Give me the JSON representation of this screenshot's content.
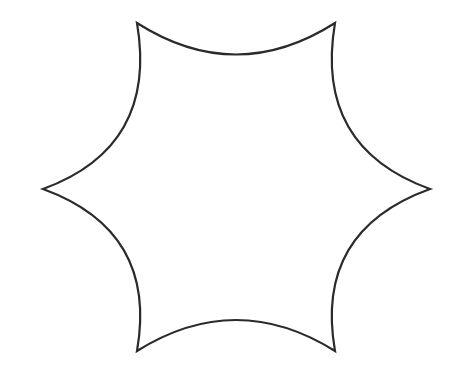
{
  "image": {
    "title": "Concave six-pointed star outline",
    "width": 457,
    "height": 371,
    "background_color": "#ffffff",
    "figure_type": "line-drawing"
  },
  "shape": {
    "name": "concave-six-pointed-star",
    "description": "Six-pointed star with sharp vertices joined by inward-bowing concave arcs",
    "fill_color": "#ffffff",
    "stroke_color": "#2b2b2b",
    "stroke_width": 2.2,
    "point_count": 6,
    "center": {
      "x": 236,
      "y": 187
    },
    "vertices": [
      {
        "name": "top-left-point",
        "x": 137,
        "y": 23
      },
      {
        "name": "top-right-point",
        "x": 335,
        "y": 23
      },
      {
        "name": "right-point",
        "x": 430,
        "y": 189
      },
      {
        "name": "bottom-right-point",
        "x": 335,
        "y": 351
      },
      {
        "name": "bottom-left-point",
        "x": 137,
        "y": 351
      },
      {
        "name": "left-point",
        "x": 43,
        "y": 189
      }
    ],
    "arcs": [
      {
        "name": "top-arc",
        "from": "top-left-point",
        "to": "top-right-point",
        "control": {
          "x": 236,
          "y": 86
        },
        "sag": 32,
        "bows": "inward-down"
      },
      {
        "name": "upper-right-arc",
        "from": "top-right-point",
        "to": "right-point",
        "control": {
          "x": 314,
          "y": 147
        },
        "bows": "inward-left"
      },
      {
        "name": "lower-right-arc",
        "from": "right-point",
        "to": "bottom-right-point",
        "control": {
          "x": 314,
          "y": 231
        },
        "bows": "inward-left"
      },
      {
        "name": "bottom-arc",
        "from": "bottom-right-point",
        "to": "bottom-left-point",
        "control": {
          "x": 236,
          "y": 289
        },
        "sag": 29,
        "bows": "inward-up"
      },
      {
        "name": "lower-left-arc",
        "from": "bottom-left-point",
        "to": "left-point",
        "control": {
          "x": 158,
          "y": 231
        },
        "bows": "inward-right"
      },
      {
        "name": "upper-left-arc",
        "from": "left-point",
        "to": "top-left-point",
        "control": {
          "x": 158,
          "y": 147
        },
        "bows": "inward-right"
      }
    ],
    "path": "M 137 23 Q 236 86 335 23 Q 314 147 430 189 Q 314 231 335 351 Q 236 289 137 351 Q 158 231 43 189 Q 158 147 137 23 Z"
  }
}
